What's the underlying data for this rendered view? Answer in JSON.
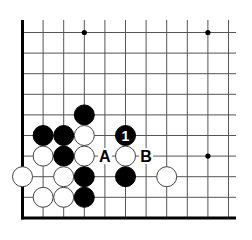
{
  "diagram": {
    "type": "go-board-fragment",
    "grid": {
      "origin_x": 22.5,
      "origin_y": 32.5,
      "spacing": 20.6,
      "cols": 11,
      "rows": 10,
      "top_extend_y": 20,
      "right_extend_x": 236,
      "edges": [
        "left",
        "bottom"
      ],
      "line_color": "#555555",
      "edge_color": "#000000"
    },
    "star_points": [
      {
        "col": 3,
        "row": 0
      },
      {
        "col": 9,
        "row": 0
      },
      {
        "col": 9,
        "row": 6
      }
    ],
    "stones": [
      {
        "col": 3,
        "row": 4,
        "color": "black"
      },
      {
        "col": 1,
        "row": 5,
        "color": "black"
      },
      {
        "col": 2,
        "row": 5,
        "color": "black"
      },
      {
        "col": 3,
        "row": 5,
        "color": "white"
      },
      {
        "col": 5,
        "row": 5,
        "color": "black",
        "label": "1"
      },
      {
        "col": 1,
        "row": 6,
        "color": "white"
      },
      {
        "col": 2,
        "row": 6,
        "color": "black"
      },
      {
        "col": 3,
        "row": 6,
        "color": "white"
      },
      {
        "col": 5,
        "row": 6,
        "color": "white"
      },
      {
        "col": 0,
        "row": 7,
        "color": "white"
      },
      {
        "col": 2,
        "row": 7,
        "color": "white"
      },
      {
        "col": 3,
        "row": 7,
        "color": "black"
      },
      {
        "col": 5,
        "row": 7,
        "color": "black"
      },
      {
        "col": 7,
        "row": 7,
        "color": "white"
      },
      {
        "col": 1,
        "row": 8,
        "color": "white"
      },
      {
        "col": 2,
        "row": 8,
        "color": "white"
      },
      {
        "col": 3,
        "row": 8,
        "color": "black"
      }
    ],
    "markers": [
      {
        "col": 4,
        "row": 6,
        "text": "A"
      },
      {
        "col": 6,
        "row": 6,
        "text": "B"
      }
    ]
  }
}
